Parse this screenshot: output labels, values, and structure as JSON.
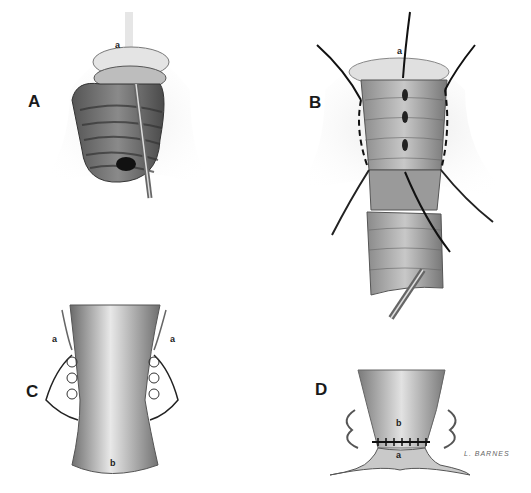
{
  "figure": {
    "panels": [
      {
        "id": "A",
        "letter": "A",
        "labels": [
          "a"
        ],
        "description": "everted rectal prolapse with instrument inserted; anal margin labeled a"
      },
      {
        "id": "B",
        "letter": "B",
        "labels": [
          "a"
        ],
        "description": "prolapsed rectum with traction sutures placed and mucosal incision"
      },
      {
        "id": "C",
        "letter": "C",
        "labels": [
          "a",
          "a",
          "b"
        ],
        "description": "longitudinal section showing plicating sutures in muscular wall"
      },
      {
        "id": "D",
        "letter": "D",
        "labels": [
          "b",
          "a"
        ],
        "description": "completed anastomosis between mucosa b and anal margin a"
      }
    ],
    "signature": "L. BARNES",
    "colors": {
      "background": "#ffffff",
      "ink": "#1a1a1a",
      "tissue_dark": "#555555",
      "tissue_light": "#cfcfcf"
    }
  }
}
